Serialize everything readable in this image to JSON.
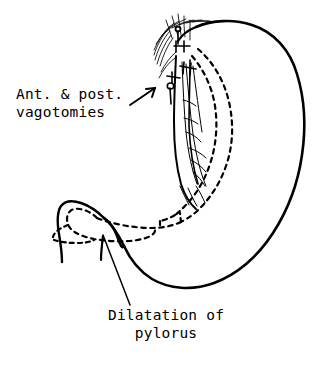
{
  "figure": {
    "type": "line-drawing",
    "background_color": "#ffffff",
    "ink_color": "#000000",
    "width": 325,
    "height": 372
  },
  "annotations": {
    "vagotomies": {
      "line1": "Ant. & post.",
      "line2": "vagotomies",
      "arrow": "arrow-up-right",
      "points_to": "esophageal vagus nerve trunks"
    },
    "pylorus": {
      "line1": "Dilatation of",
      "line2": "pylorus",
      "leader": "leader-line",
      "points_to": "pyloric channel"
    }
  },
  "anatomy": {
    "parts": [
      {
        "name": "stomach-body-outline",
        "stroke": "solid"
      },
      {
        "name": "fundus",
        "stroke": "solid"
      },
      {
        "name": "greater-curvature",
        "stroke": "solid"
      },
      {
        "name": "lesser-curvature-dashed",
        "stroke": "dashed"
      },
      {
        "name": "esophagus",
        "stroke": "solid"
      },
      {
        "name": "vagus-nerve-fibers",
        "stroke": "solid-thin"
      },
      {
        "name": "cut-nerve-hatching",
        "stroke": "solid-thin"
      },
      {
        "name": "ligature-clamps",
        "stroke": "solid"
      },
      {
        "name": "duodenal-cap",
        "stroke": "solid"
      },
      {
        "name": "pyloric-lumen-dashed",
        "stroke": "dashed"
      },
      {
        "name": "antrum-lumen-dashed",
        "stroke": "dashed"
      }
    ]
  }
}
